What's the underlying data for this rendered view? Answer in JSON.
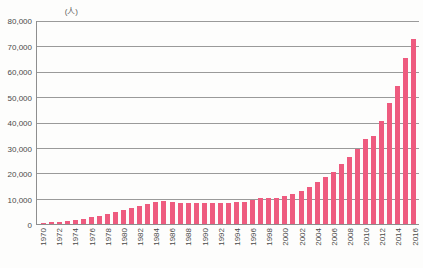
{
  "chart_data": {
    "type": "bar",
    "title": "",
    "subtitle": "",
    "xlabel": "",
    "ylabel": "",
    "unit_label": "(人)",
    "ylim": [
      0,
      80000
    ],
    "ytick_values": [
      0,
      10000,
      20000,
      30000,
      40000,
      50000,
      60000,
      70000,
      80000
    ],
    "ytick_labels": [
      "0",
      "10,000",
      "20,000",
      "30,000",
      "40,000",
      "50,000",
      "60,000",
      "70,000",
      "80,000"
    ],
    "grid": true,
    "legend": null,
    "bar_color": "#ee5b7f",
    "gridline_color": "#9a9a9a",
    "axis_color": "#8e8e8e",
    "background_color": "#fdfdfc",
    "categories": [
      "1970",
      "1971",
      "1972",
      "1973",
      "1974",
      "1975",
      "1976",
      "1977",
      "1978",
      "1979",
      "1980",
      "1981",
      "1982",
      "1983",
      "1984",
      "1985",
      "1986",
      "1987",
      "1988",
      "1989",
      "1990",
      "1991",
      "1992",
      "1993",
      "1994",
      "1995",
      "1996",
      "1997",
      "1998",
      "1999",
      "2000",
      "2001",
      "2002",
      "2003",
      "2004",
      "2005",
      "2006",
      "2007",
      "2008",
      "2009",
      "2010",
      "2011",
      "2012",
      "2013",
      "2014",
      "2015",
      "2016"
    ],
    "xtick_labels": [
      "1970",
      "1972",
      "1974",
      "1976",
      "1978",
      "1980",
      "1982",
      "1984",
      "1986",
      "1988",
      "1990",
      "1992",
      "1994",
      "1996",
      "1998",
      "2000",
      "2002",
      "2004",
      "2006",
      "2008",
      "2010",
      "2012",
      "2014",
      "2016"
    ],
    "values": [
      500,
      700,
      900,
      1200,
      1600,
      2100,
      2700,
      3300,
      4000,
      4800,
      5600,
      6400,
      7200,
      8000,
      8600,
      8900,
      8700,
      8300,
      8200,
      8100,
      8100,
      8200,
      8300,
      8400,
      8500,
      8800,
      9400,
      10200,
      10300,
      10400,
      11000,
      12000,
      13000,
      14500,
      16500,
      18500,
      20500,
      23500,
      26500,
      29500,
      33500,
      34500,
      40500,
      47500,
      54500,
      65500,
      73000
    ]
  }
}
